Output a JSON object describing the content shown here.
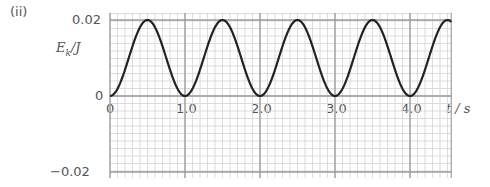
{
  "panel_label": "(ii)",
  "chart_data": {
    "type": "line",
    "title": "",
    "xlabel": "t / s",
    "ylabel": "E_k/J",
    "ylabel_main": "E",
    "ylabel_sub": "k",
    "ylabel_unit": "/J",
    "xlim": [
      0,
      4.55
    ],
    "ylim": [
      -0.02,
      0.02
    ],
    "x_ticks": [
      0,
      1.0,
      2.0,
      3.0,
      4.0
    ],
    "x_tick_labels": [
      "0",
      "1.0",
      "2.0",
      "3.0",
      "4.0"
    ],
    "y_ticks": [
      0.02,
      0,
      -0.02
    ],
    "y_tick_labels": [
      "0.02",
      "0",
      "−0.02"
    ],
    "grid": true,
    "series": [
      {
        "name": "E_k",
        "formula": "0.02*sin^2(pi*t)",
        "x": [
          0,
          0.25,
          0.5,
          0.75,
          1.0,
          1.25,
          1.5,
          1.75,
          2.0,
          2.25,
          2.5,
          2.75,
          3.0,
          3.25,
          3.5,
          3.75,
          4.0,
          4.25,
          4.5
        ],
        "values": [
          0,
          0.01,
          0.02,
          0.01,
          0,
          0.01,
          0.02,
          0.01,
          0,
          0.01,
          0.02,
          0.01,
          0,
          0.01,
          0.02,
          0.01,
          0,
          0.01,
          0.02
        ]
      }
    ]
  },
  "colors": {
    "curve": "#222222",
    "major_grid": "#9a9a9a",
    "minor_grid": "#d4d4d4",
    "text": "#555555"
  }
}
